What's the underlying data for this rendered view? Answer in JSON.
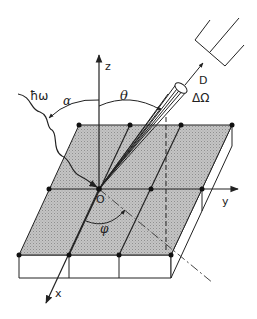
{
  "diagram": {
    "type": "photoemission geometry",
    "labels": {
      "photon": "ħω",
      "alpha": "α",
      "theta": "θ",
      "phi": "φ",
      "detector": "D",
      "solid_angle": "ΔΩ",
      "origin": "O",
      "x_axis": "x",
      "y_axis": "y",
      "z_axis": "z"
    },
    "colors": {
      "line": "#222222",
      "surface": "#b8b8b8",
      "background": "#ffffff"
    }
  }
}
